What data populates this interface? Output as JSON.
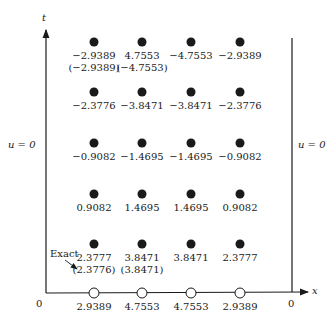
{
  "axes": {
    "t_label": "t",
    "x_label": "x",
    "origin_left": "0",
    "origin_right": "0",
    "left_boundary": "u = 0",
    "right_boundary": "u = 0"
  },
  "annotation": {
    "label": "Exact"
  },
  "columns_x": [
    94,
    142,
    191,
    240
  ],
  "rows": [
    {
      "y": 42,
      "values": [
        "−2.9389",
        "4.7553",
        "−4.7553",
        "−2.9389"
      ],
      "exact": [
        "(−2.9389)",
        "(−4.7553)",
        "",
        ""
      ]
    },
    {
      "y": 92,
      "values": [
        "−2.3776",
        "−3.8471",
        "−3.8471",
        "−2.3776"
      ],
      "exact": [
        "",
        "",
        "",
        ""
      ]
    },
    {
      "y": 143,
      "values": [
        "−0.9082",
        "−1.4695",
        "−1.4695",
        "−0.9082"
      ],
      "exact": [
        "",
        "",
        "",
        ""
      ]
    },
    {
      "y": 194,
      "values": [
        "0.9082",
        "1.4695",
        "1.4695",
        "0.9082"
      ],
      "exact": [
        "",
        "",
        "",
        ""
      ]
    },
    {
      "y": 244,
      "values": [
        "2.3777",
        "3.8471",
        "3.8471",
        "2.3777"
      ],
      "exact": [
        "(2.3776)",
        "(3.8471)",
        "",
        ""
      ]
    }
  ],
  "initial_row": {
    "y": 293,
    "values": [
      "2.9389",
      "4.7553",
      "4.7553",
      "2.9389"
    ]
  },
  "colors": {
    "ink": "#1a1a1a",
    "background": "#ffffff"
  }
}
